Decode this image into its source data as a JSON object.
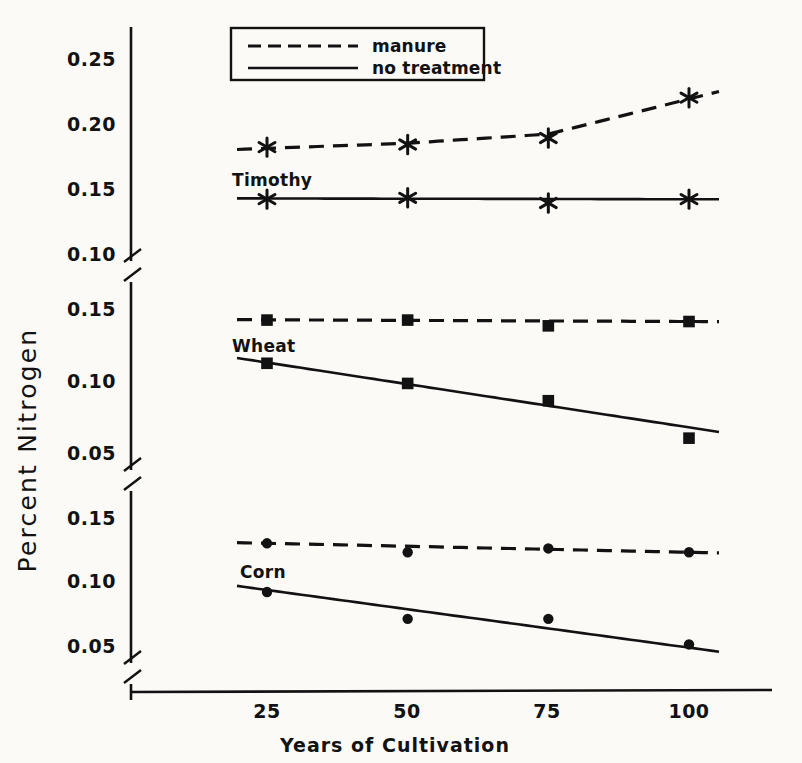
{
  "figure": {
    "y_axis_title": "Percent Nitrogen",
    "x_axis_title": "Years of Cultivation"
  },
  "legend": {
    "position": "top-center",
    "entries": [
      {
        "label": "manure",
        "style": "dashed"
      },
      {
        "label": "no treatment",
        "style": "solid"
      }
    ]
  },
  "panels": {
    "timothy": {
      "name": "Timothy",
      "ticks": [
        "0.25",
        "0.20",
        "0.15",
        "0.10"
      ]
    },
    "wheat": {
      "name": "Wheat",
      "ticks": [
        "0.15",
        "0.10",
        "0.05"
      ]
    },
    "corn": {
      "name": "Corn",
      "ticks": [
        "0.15",
        "0.10",
        "0.05"
      ]
    }
  },
  "x_ticks": [
    "25",
    "50",
    "75",
    "100"
  ],
  "chart_data": {
    "type": "line",
    "title": "",
    "xlabel": "Years of Cultivation",
    "ylabel": "Percent Nitrogen",
    "x": [
      25,
      50,
      75,
      100
    ],
    "xlim": [
      0,
      112
    ],
    "grid": false,
    "legend_position": "top-center",
    "broken_axis": true,
    "panels": [
      {
        "name": "Timothy",
        "marker": "asterisk",
        "ylim": [
          0.1,
          0.27
        ],
        "yticks": [
          0.25,
          0.2,
          0.15,
          0.1
        ],
        "series": [
          {
            "name": "manure",
            "style": "dashed",
            "points": [
              0.183,
              0.185,
              0.19,
              0.221
            ],
            "fit_line": [
              0.182,
              0.186,
              0.193,
              0.22
            ]
          },
          {
            "name": "no treatment",
            "style": "solid",
            "points": [
              0.143,
              0.144,
              0.14,
              0.143
            ],
            "fit_line": [
              0.1435,
              0.1433,
              0.1431,
              0.1429
            ]
          }
        ]
      },
      {
        "name": "Wheat",
        "marker": "square",
        "ylim": [
          0.04,
          0.16
        ],
        "yticks": [
          0.15,
          0.1,
          0.05
        ],
        "series": [
          {
            "name": "manure",
            "style": "dashed",
            "points": [
              0.143,
              0.143,
              0.139,
              0.142
            ],
            "fit_line": [
              0.1432,
              0.1428,
              0.1424,
              0.142
            ]
          },
          {
            "name": "no treatment",
            "style": "solid",
            "points": [
              0.113,
              0.099,
              0.087,
              0.061
            ],
            "fit_line": [
              0.1135,
              0.0985,
              0.0835,
              0.0685
            ]
          }
        ]
      },
      {
        "name": "Corn",
        "marker": "circle",
        "ylim": [
          0.04,
          0.16
        ],
        "yticks": [
          0.15,
          0.1,
          0.05
        ],
        "series": [
          {
            "name": "manure",
            "style": "dashed",
            "points": [
              0.131,
              0.124,
              0.127,
              0.124
            ],
            "fit_line": [
              0.131,
              0.1287,
              0.1263,
              0.124
            ]
          },
          {
            "name": "no treatment",
            "style": "solid",
            "points": [
              0.093,
              0.072,
              0.072,
              0.052
            ],
            "fit_line": [
              0.0945,
              0.0795,
              0.0645,
              0.0495
            ]
          }
        ]
      }
    ]
  }
}
